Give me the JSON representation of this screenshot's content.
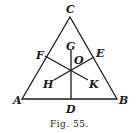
{
  "figure": {
    "caption": "Fig. 55.",
    "labels": {
      "A": "A",
      "B": "B",
      "C": "C",
      "D": "D",
      "E": "E",
      "F": "F",
      "G": "G",
      "H": "H",
      "K": "K",
      "O": "O"
    }
  }
}
